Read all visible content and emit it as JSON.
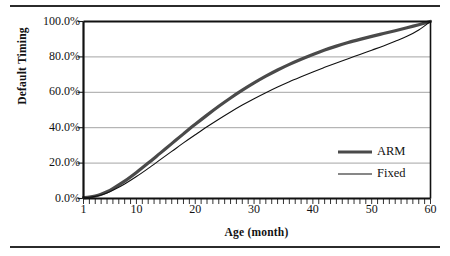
{
  "figure": {
    "background": "#ffffff",
    "rule_color": "#2b2b2b"
  },
  "chart_data": {
    "type": "line",
    "title": "",
    "xlabel": "Age (month)",
    "ylabel": "Default Timing",
    "xlim": [
      1,
      60
    ],
    "ylim": [
      0,
      1
    ],
    "grid": "horizontal",
    "legend_position": "inside-lower-right",
    "x_ticks": [
      1,
      10,
      20,
      30,
      40,
      50,
      60
    ],
    "x_tick_labels": [
      "1",
      "10",
      "20",
      "30",
      "40",
      "50",
      "60"
    ],
    "x_minor_tick_interval": 1,
    "y_ticks": [
      0,
      0.2,
      0.4,
      0.6,
      0.8,
      1.0
    ],
    "y_tick_labels": [
      "0.0%",
      "20.0%",
      "40.0%",
      "60.0%",
      "80.0%",
      "100.0%"
    ],
    "x": [
      1,
      2,
      3,
      4,
      5,
      6,
      8,
      10,
      12,
      14,
      16,
      18,
      20,
      22,
      24,
      26,
      28,
      30,
      32,
      34,
      36,
      38,
      40,
      42,
      44,
      46,
      48,
      50,
      52,
      54,
      56,
      58,
      60
    ],
    "series": [
      {
        "name": "ARM",
        "color": "#4a4a4a",
        "line_width": 3.2,
        "values": [
          0.005,
          0.008,
          0.014,
          0.024,
          0.038,
          0.056,
          0.098,
          0.147,
          0.2,
          0.255,
          0.31,
          0.365,
          0.419,
          0.471,
          0.521,
          0.568,
          0.612,
          0.653,
          0.691,
          0.726,
          0.758,
          0.787,
          0.814,
          0.839,
          0.861,
          0.881,
          0.899,
          0.916,
          0.932,
          0.948,
          0.965,
          0.982,
          1.0
        ]
      },
      {
        "name": "Fixed",
        "color": "#101010",
        "line_width": 1.1,
        "values": [
          0.004,
          0.007,
          0.012,
          0.02,
          0.031,
          0.046,
          0.082,
          0.124,
          0.17,
          0.218,
          0.266,
          0.314,
          0.36,
          0.405,
          0.448,
          0.489,
          0.528,
          0.564,
          0.598,
          0.63,
          0.66,
          0.688,
          0.715,
          0.741,
          0.766,
          0.79,
          0.814,
          0.838,
          0.862,
          0.888,
          0.916,
          0.952,
          1.0
        ]
      }
    ],
    "legend": [
      {
        "label": "ARM",
        "color": "#4a4a4a",
        "line_width": 3.2
      },
      {
        "label": "Fixed",
        "color": "#101010",
        "line_width": 1.1
      }
    ]
  }
}
